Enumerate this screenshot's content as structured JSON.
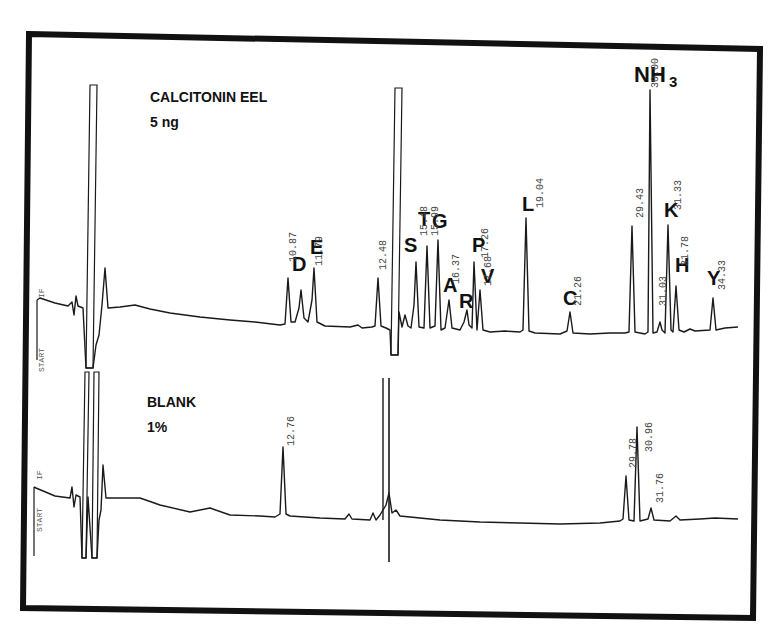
{
  "panels": {
    "sample": {
      "title": "CALCITONIN EEL",
      "subtitle": "5 ng",
      "start_label": "START",
      "if_label": "IF"
    },
    "blank": {
      "title": "BLANK",
      "subtitle": "1%",
      "start_label": "START",
      "if_label": "IF"
    }
  },
  "colors": {
    "trace": "#1a1a1a",
    "frame": "#111111",
    "background": "#ffffff"
  },
  "chart_data": [
    {
      "type": "line",
      "title": "CALCITONIN EEL 5 ng",
      "xlabel": "Retention time (min)",
      "ylabel": "Detector response",
      "grid": false,
      "legend": null,
      "peaks": [
        {
          "label": "",
          "rt": "~5.0",
          "height": "off-scale",
          "note": "injection/solvent front"
        },
        {
          "label": "D",
          "rt": "10.87",
          "height": 45
        },
        {
          "label": "",
          "rt": "11.3",
          "height": 28
        },
        {
          "label": "E",
          "rt": "11.79",
          "height": 42
        },
        {
          "label": "",
          "rt": "12.48",
          "height": 45
        },
        {
          "label": "",
          "rt": "~13.5",
          "height": "off-scale",
          "note": "buffer change"
        },
        {
          "label": "S",
          "rt": "15.0",
          "height": 55
        },
        {
          "label": "T",
          "rt": "15.48",
          "height": 70
        },
        {
          "label": "G",
          "rt": "15.99",
          "height": 80
        },
        {
          "label": "A",
          "rt": "16.37",
          "height": 25
        },
        {
          "label": "R",
          "rt": "16.9",
          "height": 15
        },
        {
          "label": "P",
          "rt": "17.26",
          "height": 60
        },
        {
          "label": "V",
          "rt": "17.68",
          "height": 35
        },
        {
          "label": "L",
          "rt": "19.04",
          "height": 95
        },
        {
          "label": "C",
          "rt": "21.26",
          "height": 18
        },
        {
          "label": "",
          "rt": "29.43",
          "height": 95
        },
        {
          "label": "NH3",
          "rt": "30.00",
          "height": 230
        },
        {
          "label": "",
          "rt": "31.03",
          "height": 12
        },
        {
          "label": "K",
          "rt": "31.33",
          "height": 88
        },
        {
          "label": "H",
          "rt": "31.78",
          "height": 38
        },
        {
          "label": "Y",
          "rt": "34.33",
          "height": 28
        }
      ]
    },
    {
      "type": "line",
      "title": "BLANK 1%",
      "xlabel": "Retention time (min)",
      "ylabel": "Detector response",
      "grid": false,
      "legend": null,
      "peaks": [
        {
          "label": "",
          "rt": "~5.0",
          "height": "off-scale",
          "note": "injection/solvent front"
        },
        {
          "label": "",
          "rt": "12.76",
          "height": 55
        },
        {
          "label": "",
          "rt": "~13.5",
          "height": "off-scale",
          "note": "buffer change"
        },
        {
          "label": "",
          "rt": "29.78",
          "height": 40
        },
        {
          "label": "",
          "rt": "30.96",
          "height": 62
        },
        {
          "label": "",
          "rt": "31.76",
          "height": 10
        }
      ]
    }
  ],
  "annotations": {
    "sample": [
      {
        "text": "D",
        "x": 292,
        "y": 271,
        "size": 20
      },
      {
        "text": "E",
        "x": 310,
        "y": 254,
        "size": 20
      },
      {
        "text": "S",
        "x": 404,
        "y": 252,
        "size": 20
      },
      {
        "text": "T",
        "x": 418,
        "y": 226,
        "size": 20
      },
      {
        "text": "G",
        "x": 432,
        "y": 228,
        "size": 20
      },
      {
        "text": "A",
        "x": 443,
        "y": 292,
        "size": 20
      },
      {
        "text": "R",
        "x": 459,
        "y": 308,
        "size": 20
      },
      {
        "text": "P",
        "x": 472,
        "y": 252,
        "size": 20
      },
      {
        "text": "V",
        "x": 481,
        "y": 283,
        "size": 20
      },
      {
        "text": "L",
        "x": 522,
        "y": 211,
        "size": 20
      },
      {
        "text": "C",
        "x": 563,
        "y": 305,
        "size": 20
      },
      {
        "text": "K",
        "x": 664,
        "y": 217,
        "size": 20
      },
      {
        "text": "H",
        "x": 675,
        "y": 272,
        "size": 20
      },
      {
        "text": "Y",
        "x": 707,
        "y": 285,
        "size": 20
      }
    ],
    "nh3": {
      "main": "NH",
      "sub": "3",
      "x": 634,
      "y": 82
    },
    "rt_labels_sample": [
      {
        "text": "10.87",
        "x": 296,
        "y": 262
      },
      {
        "text": "11.79",
        "x": 322,
        "y": 266
      },
      {
        "text": "12.48",
        "x": 386,
        "y": 270
      },
      {
        "text": "15.48",
        "x": 427,
        "y": 236
      },
      {
        "text": "15.99",
        "x": 438,
        "y": 236
      },
      {
        "text": "16.37",
        "x": 459,
        "y": 284
      },
      {
        "text": "17.26",
        "x": 488,
        "y": 258
      },
      {
        "text": "17.68",
        "x": 491,
        "y": 286
      },
      {
        "text": "19.04",
        "x": 543,
        "y": 208
      },
      {
        "text": "21.26",
        "x": 581,
        "y": 306
      },
      {
        "text": "29.43",
        "x": 643,
        "y": 218
      },
      {
        "text": "30.00",
        "x": 658,
        "y": 88
      },
      {
        "text": "31.03",
        "x": 666,
        "y": 306
      },
      {
        "text": "31.33",
        "x": 681,
        "y": 210
      },
      {
        "text": "31.78",
        "x": 688,
        "y": 266
      },
      {
        "text": "34.33",
        "x": 725,
        "y": 290
      }
    ],
    "rt_labels_blank": [
      {
        "text": "12.76",
        "x": 294,
        "y": 446
      },
      {
        "text": "29.78",
        "x": 636,
        "y": 468
      },
      {
        "text": "30.96",
        "x": 652,
        "y": 452
      },
      {
        "text": "31.76",
        "x": 663,
        "y": 503
      }
    ]
  }
}
